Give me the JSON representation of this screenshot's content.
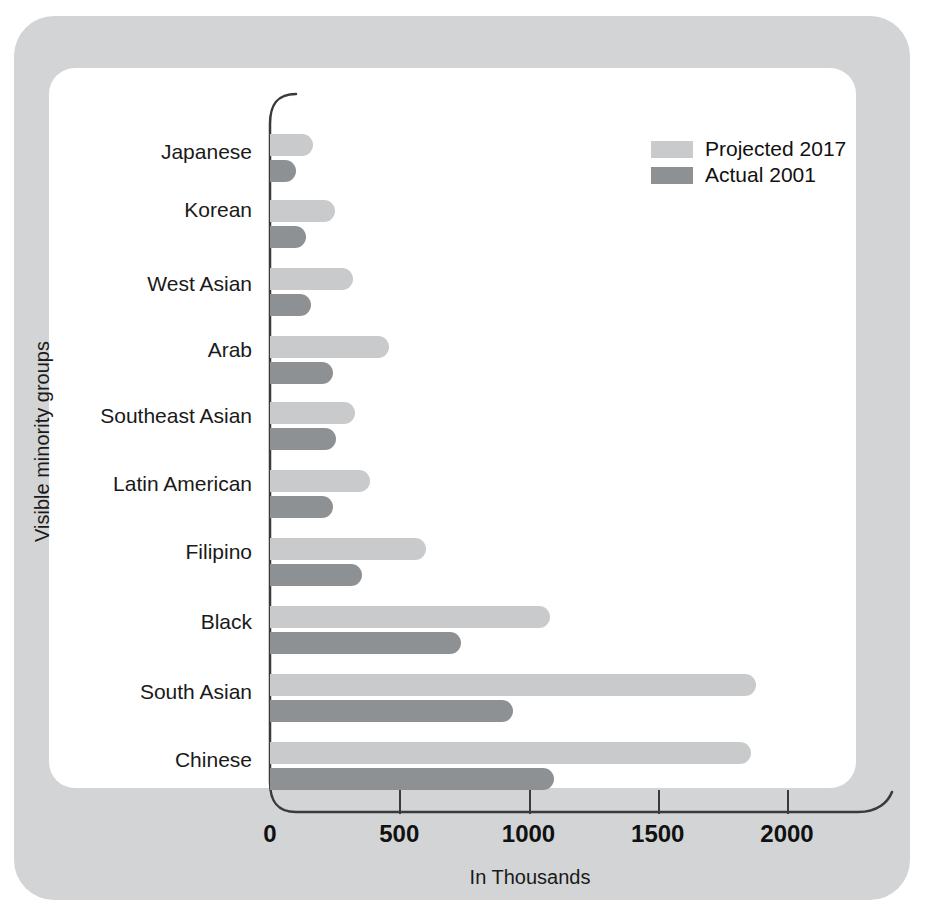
{
  "chart_data": {
    "type": "bar",
    "orientation": "horizontal",
    "title": "",
    "xlabel": "In Thousands",
    "ylabel": "Visible minority groups",
    "xlim": [
      0,
      2100
    ],
    "xticks": [
      0,
      500,
      1000,
      1500,
      2000
    ],
    "xtick_labels": [
      "0",
      "500",
      "1000",
      "1500",
      "2000"
    ],
    "grid": false,
    "legend_position": "top-right",
    "categories": [
      "Japanese",
      "Korean",
      "West Asian",
      "Arab",
      "Southeast Asian",
      "Latin American",
      "Filipino",
      "Black",
      "South Asian",
      "Chinese"
    ],
    "series": [
      {
        "name": "Projected 2017",
        "color": "#c8cacb",
        "values": [
          165,
          250,
          320,
          460,
          330,
          385,
          605,
          1085,
          1880,
          1860
        ]
      },
      {
        "name": "Actual 2001",
        "color": "#8d9193",
        "values": [
          100,
          140,
          160,
          245,
          255,
          245,
          355,
          740,
          940,
          1100
        ]
      }
    ]
  },
  "legend": {
    "items": [
      {
        "label": "Projected 2017",
        "swatch": "projected"
      },
      {
        "label": "Actual 2001",
        "swatch": "actual"
      }
    ]
  },
  "colors": {
    "frame": "#d2d4d5",
    "panel": "#ffffff",
    "projected": "#c8cacb",
    "actual": "#8d9193",
    "axis": "#3a3a3a",
    "text": "#111111"
  }
}
